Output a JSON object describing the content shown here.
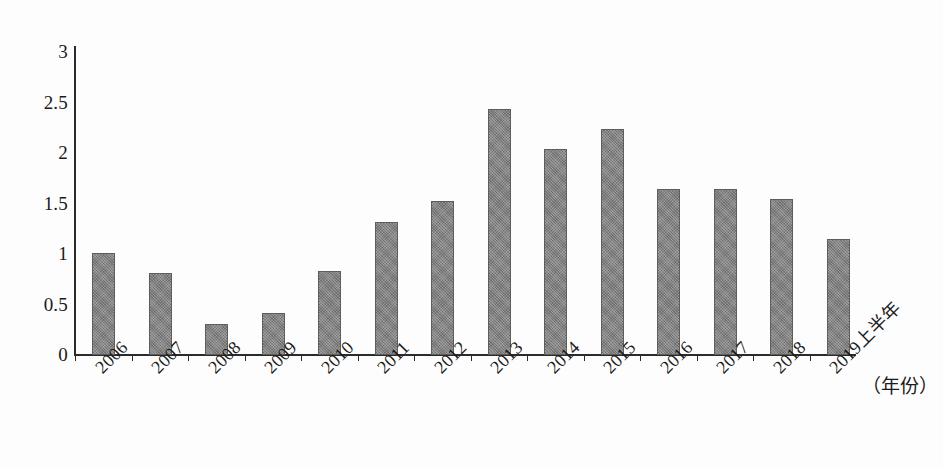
{
  "chart_data": {
    "type": "bar",
    "title": "",
    "subtitle": "",
    "xlabel": "（年份）",
    "ylabel": "",
    "categories": [
      "2006",
      "2007",
      "2008",
      "2009",
      "2010",
      "2011",
      "2012",
      "2013",
      "2014",
      "2015",
      "2016",
      "2017",
      "2018",
      "2019上半年"
    ],
    "values": [
      1.01,
      0.81,
      0.31,
      0.42,
      0.83,
      1.32,
      1.52,
      2.44,
      2.04,
      2.24,
      1.64,
      1.64,
      1.54,
      1.15
    ],
    "series": [
      {
        "name": "",
        "values": [
          1.01,
          0.81,
          0.31,
          0.42,
          0.83,
          1.32,
          1.52,
          2.44,
          2.04,
          2.24,
          1.64,
          1.64,
          1.54,
          1.15
        ]
      }
    ],
    "ylim": [
      0,
      3
    ],
    "ytick_labels": [
      "0",
      "0.5",
      "1",
      "1.5",
      "2",
      "2.5",
      "3"
    ],
    "ytick_values": [
      0,
      0.5,
      1,
      1.5,
      2,
      2.5,
      3
    ],
    "grid": false,
    "legend": false,
    "legend_position": "none",
    "bar_color": "#7c7c7c",
    "bar_border_color": "#5d5d5d",
    "axis_color": "#2b2b2b",
    "background_color": "#fdfdfd",
    "xtick_rotation": 45,
    "annotations": []
  }
}
